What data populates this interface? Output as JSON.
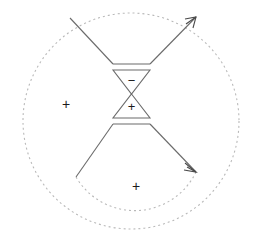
{
  "figure": {
    "title": "",
    "background_color": "#ffffff",
    "width": 263,
    "height": 251,
    "line_color": "#6b6b6b",
    "dashed_color": "#b9b9b9",
    "glyph_color": "#1a1a1a"
  },
  "labels": {
    "charge_left": "+",
    "charge_bottom": "+",
    "bowtie_upper_sign": "−",
    "bowtie_lower_sign": "+"
  },
  "elements": {
    "outer_boundary_name": "outer dashed circle",
    "inner_boundary_name": "inner dashed arc",
    "upper_cone_name": "upper cone",
    "lower_cone_name": "lower cone",
    "bowtie_name": "bowtie antenna",
    "upper_arrow_name": "upper outgoing ray",
    "lower_arrow_name": "lower outgoing ray"
  },
  "geometry": {
    "outer_circle": {
      "cx": 131,
      "cy": 121,
      "r": 108
    },
    "inner_arc": {
      "cx": 131,
      "cy": 121,
      "r": 68
    },
    "bowtie": {
      "top_left": [
        113,
        70
      ],
      "top_right": [
        150,
        70
      ],
      "waist": [
        131.5,
        94
      ],
      "bottom_left": [
        113,
        118
      ],
      "bottom_right": [
        150,
        118
      ]
    },
    "upper_cone": {
      "left_end": [
        70,
        18
      ],
      "apex_left": [
        113,
        64
      ],
      "apex_right": [
        150,
        64
      ],
      "arrow_tip": [
        196,
        17
      ]
    },
    "lower_cone": {
      "left_end": [
        76,
        177
      ],
      "apex_left": [
        113,
        124
      ],
      "apex_right": [
        150,
        124
      ],
      "arrow_tip": [
        196,
        172
      ]
    },
    "charge_left_pos": [
      66,
      105
    ],
    "charge_bottom_pos": [
      136,
      187
    ]
  }
}
